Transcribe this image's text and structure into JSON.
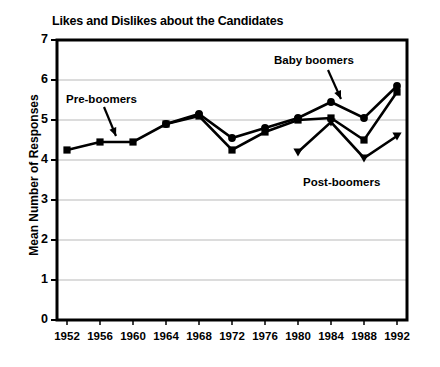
{
  "chart_data": {
    "type": "line",
    "title": "Likes and Dislikes about the Candidates",
    "xlabel": "",
    "ylabel": "Mean Number of Responses",
    "categories": [
      "1952",
      "1956",
      "1960",
      "1964",
      "1968",
      "1972",
      "1976",
      "1980",
      "1984",
      "1988",
      "1992"
    ],
    "x_tick_labels": [
      "1952",
      "1956",
      "1960",
      "1964",
      "1968",
      "1972",
      "1976",
      "1980",
      "1984",
      "1988",
      "1992"
    ],
    "y_tick_labels": [
      "0",
      "1",
      "2",
      "3",
      "4",
      "5",
      "6",
      "7"
    ],
    "ylim": [
      0,
      7
    ],
    "grid": true,
    "legend_position": "none",
    "series": [
      {
        "name": "Pre-boomers",
        "marker": "square",
        "color": "#000000",
        "values": [
          4.25,
          4.45,
          4.45,
          4.9,
          5.1,
          4.25,
          4.7,
          5.0,
          5.05,
          4.5,
          5.7
        ]
      },
      {
        "name": "Baby boomers",
        "marker": "circle",
        "color": "#000000",
        "values": [
          null,
          null,
          null,
          4.9,
          5.15,
          4.55,
          4.8,
          5.05,
          5.45,
          5.05,
          5.85
        ]
      },
      {
        "name": "Post-boomers",
        "marker": "triangle",
        "color": "#000000",
        "values": [
          null,
          null,
          null,
          null,
          null,
          null,
          null,
          4.2,
          4.95,
          4.05,
          4.6
        ]
      }
    ],
    "annotations": [
      {
        "text": "Pre-boomers",
        "series": "Pre-boomers"
      },
      {
        "text": "Baby boomers",
        "series": "Baby boomers"
      },
      {
        "text": "Post-boomers",
        "series": "Post-boomers"
      }
    ]
  }
}
